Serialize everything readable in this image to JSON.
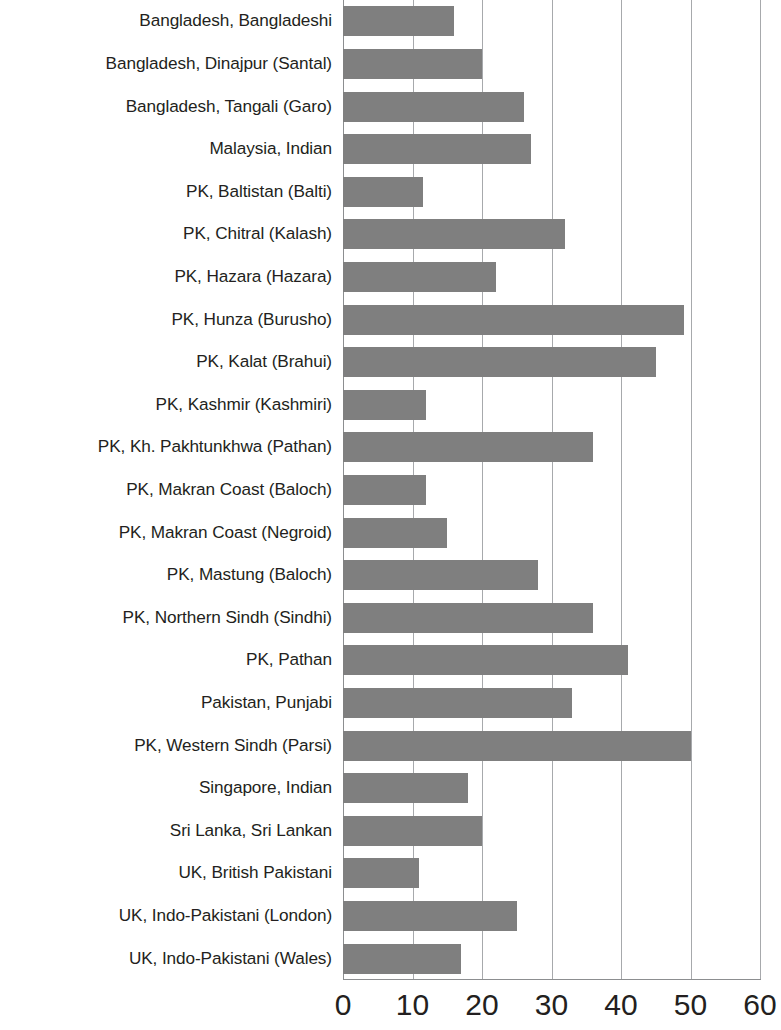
{
  "chart_data": {
    "type": "bar",
    "orientation": "horizontal",
    "title": "",
    "subtitle": "",
    "xlabel": "",
    "ylabel": "",
    "xlim": [
      0,
      60
    ],
    "xticks": [
      0,
      10,
      20,
      30,
      40,
      50,
      60
    ],
    "xtick_labels": [
      "0",
      "10",
      "20",
      "30",
      "40",
      "50",
      "60"
    ],
    "grid": "vertical",
    "legend": "none",
    "bar_color": "#7f7f7f",
    "gridline_color": "#a7a9ac",
    "text_color": "#231f20",
    "categories": [
      "Bangladesh, Bangladeshi",
      "Bangladesh, Dinajpur (Santal)",
      "Bangladesh, Tangali (Garo)",
      "Malaysia, Indian",
      "PK, Baltistan (Balti)",
      "PK, Chitral (Kalash)",
      "PK, Hazara (Hazara)",
      "PK, Hunza (Burusho)",
      "PK, Kalat (Brahui)",
      "PK, Kashmir (Kashmiri)",
      "PK, Kh. Pakhtunkhwa (Pathan)",
      "PK, Makran Coast (Baloch)",
      "PK, Makran Coast (Negroid)",
      "PK, Mastung (Baloch)",
      "PK, Northern Sindh (Sindhi)",
      "PK, Pathan",
      "Pakistan, Punjabi",
      "PK, Western Sindh (Parsi)",
      "Singapore, Indian",
      "Sri Lanka, Sri Lankan",
      "UK, British Pakistani",
      "UK, Indo-Pakistani (London)",
      "UK, Indo-Pakistani (Wales)"
    ],
    "values": [
      16,
      20,
      26,
      27,
      11.5,
      32,
      22,
      49,
      45,
      12,
      36,
      12,
      15,
      28,
      36,
      41,
      33,
      50,
      18,
      20,
      11,
      25,
      17
    ]
  }
}
